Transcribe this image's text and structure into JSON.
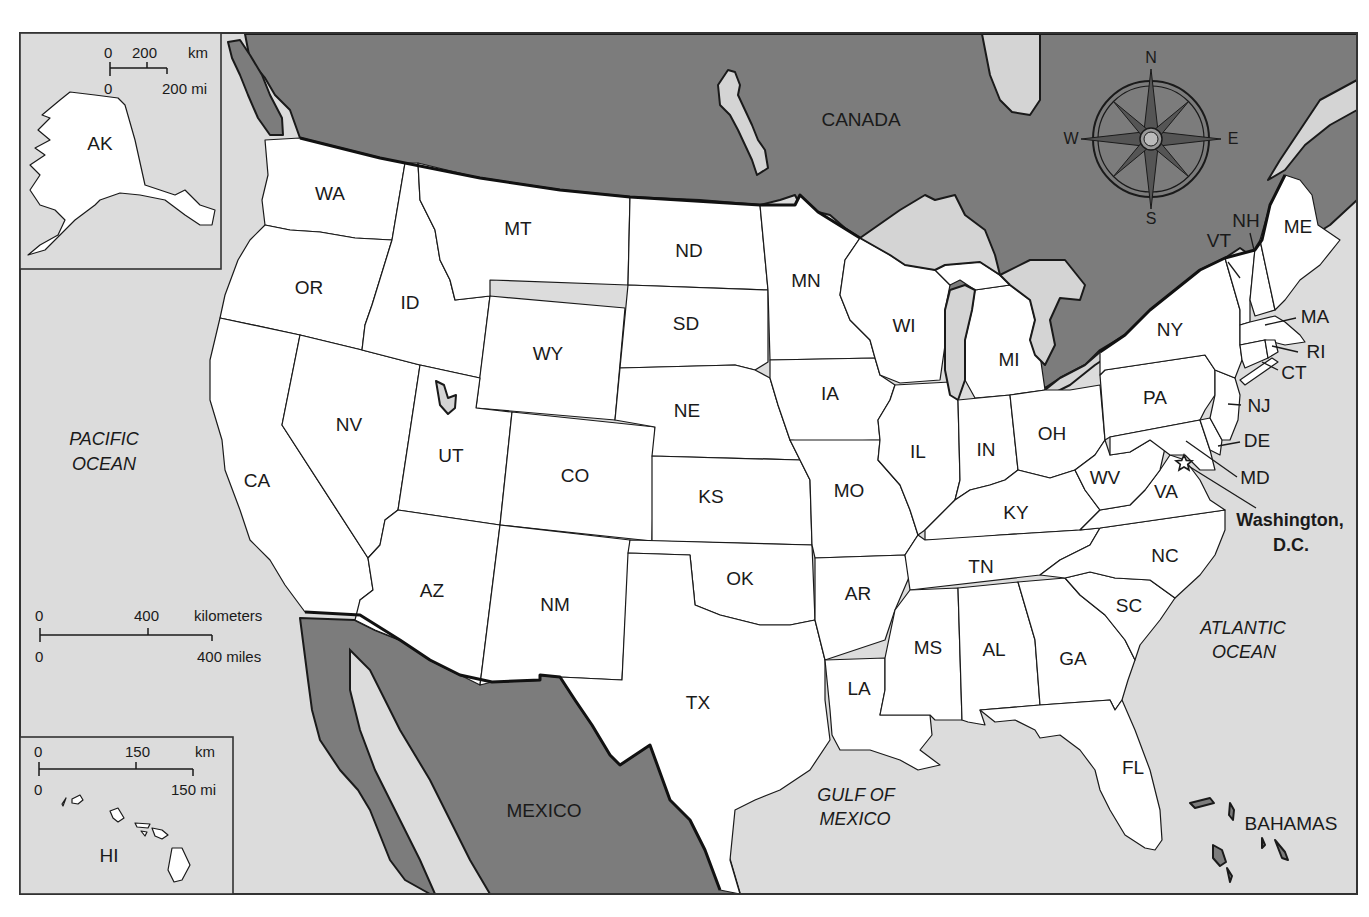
{
  "map": {
    "title": "United States",
    "colors": {
      "water": "#dcdcdc",
      "foreign_land": "#7c7c7c",
      "us_land": "#ffffff",
      "outline": "#1a1a1a"
    }
  },
  "countries": {
    "canada": "CANADA",
    "mexico": "MEXICO",
    "bahamas": "BAHAMAS"
  },
  "water_bodies": {
    "pacific_line1": "PACIFIC",
    "pacific_line2": "OCEAN",
    "atlantic_line1": "ATLANTIC",
    "atlantic_line2": "OCEAN",
    "gulf_line1": "GULF OF",
    "gulf_line2": "MEXICO"
  },
  "capital": {
    "line1": "Washington,",
    "line2": "D.C.",
    "icon": "star-icon"
  },
  "compass": {
    "n": "N",
    "s": "S",
    "e": "E",
    "w": "W",
    "icon": "compass-rose-icon"
  },
  "states": {
    "WA": "WA",
    "OR": "OR",
    "CA": "CA",
    "ID": "ID",
    "NV": "NV",
    "MT": "MT",
    "WY": "WY",
    "UT": "UT",
    "AZ": "AZ",
    "CO": "CO",
    "NM": "NM",
    "ND": "ND",
    "SD": "SD",
    "NE": "NE",
    "KS": "KS",
    "OK": "OK",
    "TX": "TX",
    "MN": "MN",
    "IA": "IA",
    "MO": "MO",
    "AR": "AR",
    "LA": "LA",
    "WI": "WI",
    "IL": "IL",
    "MI": "MI",
    "IN": "IN",
    "OH": "OH",
    "KY": "KY",
    "TN": "TN",
    "MS": "MS",
    "AL": "AL",
    "GA": "GA",
    "FL": "FL",
    "SC": "SC",
    "NC": "NC",
    "VA": "VA",
    "WV": "WV",
    "PA": "PA",
    "NY": "NY",
    "VT": "VT",
    "NH": "NH",
    "ME": "ME",
    "MA": "MA",
    "RI": "RI",
    "CT": "CT",
    "NJ": "NJ",
    "DE": "DE",
    "MD": "MD",
    "AK": "AK",
    "HI": "HI"
  },
  "scales": {
    "main": {
      "km_zero": "0",
      "km_mid": "400",
      "km_unit": "kilometers",
      "mi_zero": "0",
      "mi_end": "400 miles"
    },
    "alaska": {
      "km_zero": "0",
      "km_mid": "200",
      "km_unit": "km",
      "mi_zero": "0",
      "mi_end": "200 mi"
    },
    "hawaii": {
      "km_zero": "0",
      "km_mid": "150",
      "km_unit": "km",
      "mi_zero": "0",
      "mi_end": "150 mi"
    }
  }
}
